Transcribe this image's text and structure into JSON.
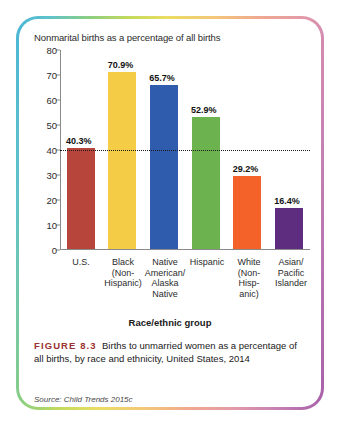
{
  "figure": {
    "number_label": "FIGURE 8.3",
    "caption": "Births to unmarried women as a percentage of all births, by race and ethnicity, United States, 2014",
    "source": "Source: Child Trends 2015c"
  },
  "chart_data": {
    "type": "bar",
    "title": "Nonmarital births as a percentage of all births",
    "xlabel": "Race/ethnic group",
    "ylabel": "",
    "ylim": [
      0,
      80
    ],
    "yticks": [
      0,
      10,
      20,
      30,
      40,
      50,
      60,
      70,
      80
    ],
    "ytick_labels": [
      "0",
      "10",
      "20",
      "30",
      "40",
      "50",
      "60",
      "70",
      "80"
    ],
    "grid": false,
    "legend": "none",
    "reference_line": {
      "value": 40,
      "style": "dotted",
      "color": "#1a1a1a"
    },
    "categories": [
      "U.S.",
      "Black (Non-Hispanic)",
      "Native American/ Alaska Native",
      "Hispanic",
      "White (Non-Hisp- anic)",
      "Asian/ Pacific Islander"
    ],
    "category_lines": [
      [
        "U.S."
      ],
      [
        "Black",
        "(Non-",
        "Hispanic)"
      ],
      [
        "Native",
        "American/",
        "Alaska",
        "Native"
      ],
      [
        "Hispanic"
      ],
      [
        "White",
        "(Non-",
        "Hisp-",
        "anic)"
      ],
      [
        "Asian/",
        "Pacific",
        "Islander"
      ]
    ],
    "values": [
      40.3,
      70.9,
      65.7,
      52.9,
      29.2,
      16.4
    ],
    "value_labels": [
      "40.3%",
      "70.9%",
      "65.7%",
      "52.9%",
      "29.2%",
      "16.4%"
    ],
    "colors": [
      "#b8453c",
      "#f5cc45",
      "#2f5cad",
      "#6cb24e",
      "#f4622a",
      "#5e2d7f"
    ]
  }
}
